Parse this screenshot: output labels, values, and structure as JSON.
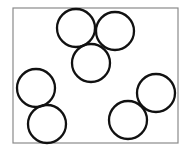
{
  "diagram": {
    "frame": {
      "x": 13,
      "y": 8,
      "width": 165,
      "height": 135,
      "stroke": "#8a8a8a",
      "stroke_width": 1.2
    },
    "circle_style": {
      "stroke": "#111111",
      "stroke_width": 2.3,
      "fill": "none"
    },
    "groups": [
      {
        "name": "top-cluster",
        "circles": [
          {
            "cx": 76,
            "cy": 28,
            "r": 19
          },
          {
            "cx": 115,
            "cy": 31,
            "r": 19
          },
          {
            "cx": 91,
            "cy": 63,
            "r": 19
          }
        ]
      },
      {
        "name": "bottom-left-pair",
        "circles": [
          {
            "cx": 36,
            "cy": 88,
            "r": 19
          },
          {
            "cx": 47,
            "cy": 124,
            "r": 19
          }
        ]
      },
      {
        "name": "bottom-right-pair",
        "circles": [
          {
            "cx": 156,
            "cy": 93,
            "r": 19
          },
          {
            "cx": 128,
            "cy": 120,
            "r": 19
          }
        ]
      }
    ]
  }
}
